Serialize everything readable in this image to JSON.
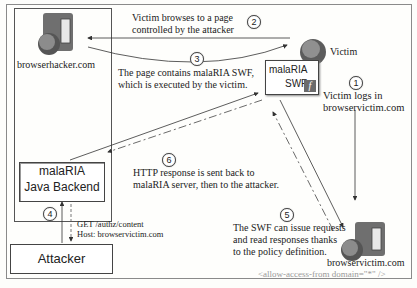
{
  "nodes": {
    "attacker_server": {
      "label": "browserhacker.com",
      "icon": "server-globe-icon"
    },
    "victim": {
      "label": "Victim",
      "icon": "browser-globe-icon"
    },
    "swf": {
      "line1": "malaRIA",
      "line2": "SWF",
      "icon": "flash-icon",
      "icon_glyph": "f"
    },
    "backend": {
      "line1": "malaRIA",
      "line2": "Java Backend"
    },
    "attacker": {
      "label": "Attacker"
    },
    "victim_server": {
      "label": "browservictim.com",
      "policy": "<allow-access-from domain=\"*\" />",
      "icon": "server-globe-icon"
    }
  },
  "steps": [
    {
      "num": "1",
      "lines": [
        "Victim logs in",
        "browservictim.com"
      ]
    },
    {
      "num": "2",
      "lines": [
        "Victim browses to a page",
        "controlled by the attacker"
      ]
    },
    {
      "num": "3",
      "lines": [
        "The page contains malaRIA SWF,",
        "which is executed by the victim."
      ]
    },
    {
      "num": "4",
      "lines": [
        "GET /authz/content",
        "Host: browservictim.com"
      ]
    },
    {
      "num": "5",
      "lines": [
        "The SWF can issue requests",
        "and read responses thanks",
        "to the policy definition."
      ]
    },
    {
      "num": "6",
      "lines": [
        "HTTP response is sent back to",
        "malaRIA server, then to the attacker."
      ]
    }
  ]
}
